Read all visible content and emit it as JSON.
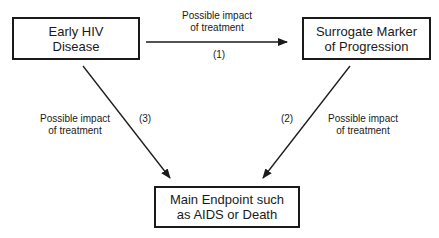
{
  "diagram": {
    "nodes": [
      {
        "id": "early-hiv",
        "lines": [
          "Early HIV",
          "Disease"
        ]
      },
      {
        "id": "surrogate",
        "lines": [
          "Surrogate Marker",
          "of Progression"
        ]
      },
      {
        "id": "endpoint",
        "lines": [
          "Main Endpoint such",
          "as AIDS or Death"
        ]
      }
    ],
    "edges": [
      {
        "id": "1",
        "from": "early-hiv",
        "to": "surrogate",
        "number": "(1)",
        "label_lines": [
          "Possible impact",
          "of treatment"
        ]
      },
      {
        "id": "2",
        "from": "surrogate",
        "to": "endpoint",
        "number": "(2)",
        "label_lines": [
          "Possible impact",
          "of treatment"
        ]
      },
      {
        "id": "3",
        "from": "early-hiv",
        "to": "endpoint",
        "number": "(3)",
        "label_lines": [
          "Possible impact",
          "of treatment"
        ]
      }
    ],
    "colors": {
      "stroke": "#1a1a1a",
      "background": "#ffffff"
    }
  }
}
